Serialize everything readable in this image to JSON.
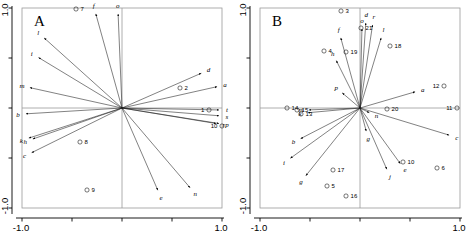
{
  "figure": {
    "title": "",
    "panels": [
      {
        "letter": "A",
        "axis": {
          "xlabels": [
            "-1.0",
            "1.0"
          ],
          "ylabels": [
            "1.0",
            "-1.0"
          ],
          "xlim": [
            -1.0,
            1.0
          ],
          "ylim": [
            -1.0,
            1.0
          ]
        }
      },
      {
        "letter": "B",
        "axis": {
          "xlabels": [
            "-1.0",
            "1.0"
          ],
          "ylabels": [
            "1.0",
            "-1.0"
          ],
          "xlim": [
            -1.0,
            1.0
          ],
          "ylim": [
            -1.0,
            1.0
          ]
        }
      }
    ]
  },
  "chart_data": [
    {
      "type": "scatter",
      "title": "A",
      "subtitle": "",
      "xlabel": "",
      "ylabel": "",
      "xlim": [
        -1.0,
        1.0
      ],
      "ylim": [
        -1.0,
        1.0
      ],
      "grid": false,
      "legend": "none",
      "axis_lines": [
        "x=0",
        "y=0"
      ],
      "vectors": [
        {
          "label": "a",
          "x": 0.98,
          "y": 0.22
        },
        {
          "label": "b",
          "x": -0.99,
          "y": -0.06
        },
        {
          "label": "c",
          "x": -0.93,
          "y": -0.46
        },
        {
          "label": "d",
          "x": 0.82,
          "y": 0.36
        },
        {
          "label": "e",
          "x": 0.37,
          "y": -0.85
        },
        {
          "label": "f",
          "x": -0.27,
          "y": 0.97
        },
        {
          "label": "h",
          "x": -0.92,
          "y": -0.32
        },
        {
          "label": "i",
          "x": -0.86,
          "y": 0.52
        },
        {
          "label": "k",
          "x": -0.96,
          "y": -0.31
        },
        {
          "label": "l",
          "x": -0.8,
          "y": 0.72
        },
        {
          "label": "m",
          "x": -0.95,
          "y": 0.21
        },
        {
          "label": "n",
          "x": 0.7,
          "y": -0.82
        },
        {
          "label": "o",
          "x": -0.04,
          "y": 0.97
        },
        {
          "label": "p",
          "x": 1.0,
          "y": -0.16
        },
        {
          "label": "r",
          "x": 0.97,
          "y": -0.16
        },
        {
          "label": "s",
          "x": 1.0,
          "y": -0.08
        },
        {
          "label": "t",
          "x": 1.0,
          "y": -0.02
        }
      ],
      "points": [
        {
          "label": "1",
          "x": 0.87,
          "y": -0.02
        },
        {
          "label": "2",
          "x": 0.58,
          "y": 0.2
        },
        {
          "label": "7",
          "x": -0.46,
          "y": 0.99
        },
        {
          "label": "8",
          "x": -0.42,
          "y": -0.34
        },
        {
          "label": "9",
          "x": -0.35,
          "y": -0.82
        },
        {
          "label": "10",
          "x": 1.0,
          "y": -0.18
        }
      ]
    },
    {
      "type": "scatter",
      "title": "B",
      "subtitle": "",
      "xlabel": "",
      "ylabel": "",
      "xlim": [
        -1.0,
        1.0
      ],
      "ylim": [
        -1.0,
        1.0
      ],
      "grid": false,
      "legend": "none",
      "axis_lines": [
        "x=0",
        "y=0"
      ],
      "vectors": [
        {
          "label": "a",
          "x": 0.58,
          "y": 0.17
        },
        {
          "label": "b",
          "x": -0.62,
          "y": -0.32
        },
        {
          "label": "c",
          "x": 0.92,
          "y": -0.28
        },
        {
          "label": "d",
          "x": 0.06,
          "y": 0.88
        },
        {
          "label": "e",
          "x": 0.42,
          "y": -0.58
        },
        {
          "label": "f",
          "x": -0.2,
          "y": 0.73
        },
        {
          "label": "g",
          "x": 0.07,
          "y": -0.26
        },
        {
          "label": "h",
          "x": -0.25,
          "y": 0.5
        },
        {
          "label": "i",
          "x": -0.72,
          "y": -0.52
        },
        {
          "label": "j",
          "x": 0.28,
          "y": -0.64
        },
        {
          "label": "k",
          "x": -0.55,
          "y": -0.05
        },
        {
          "label": "l",
          "x": 0.22,
          "y": 0.73
        },
        {
          "label": "m",
          "x": -0.54,
          "y": -0.02
        },
        {
          "label": "n",
          "x": 0.12,
          "y": -0.06
        },
        {
          "label": "o",
          "x": 0.02,
          "y": 0.82
        },
        {
          "label": "p",
          "x": -0.2,
          "y": 0.17
        },
        {
          "label": "r",
          "x": 0.13,
          "y": 0.86
        },
        {
          "label": "g2",
          "x": -0.56,
          "y": -0.7
        }
      ],
      "points": [
        {
          "label": "3",
          "x": -0.19,
          "y": 0.97
        },
        {
          "label": "4",
          "x": -0.36,
          "y": 0.57
        },
        {
          "label": "5",
          "x": -0.33,
          "y": -0.78
        },
        {
          "label": "6",
          "x": 0.77,
          "y": -0.6
        },
        {
          "label": "10",
          "x": 0.43,
          "y": -0.54
        },
        {
          "label": "11",
          "x": 0.97,
          "y": 0.0
        },
        {
          "label": "12",
          "x": 0.84,
          "y": 0.22
        },
        {
          "label": "13",
          "x": -0.59,
          "y": -0.06
        },
        {
          "label": "14",
          "x": -0.73,
          "y": 0.0
        },
        {
          "label": "15",
          "x": -0.63,
          "y": -0.02
        },
        {
          "label": "16",
          "x": -0.14,
          "y": -0.88
        },
        {
          "label": "17",
          "x": -0.27,
          "y": -0.62
        },
        {
          "label": "18",
          "x": 0.3,
          "y": 0.62
        },
        {
          "label": "19",
          "x": -0.14,
          "y": 0.56
        },
        {
          "label": "20",
          "x": 0.27,
          "y": -0.01
        },
        {
          "label": "21",
          "x": 0.01,
          "y": 0.8
        }
      ]
    }
  ]
}
